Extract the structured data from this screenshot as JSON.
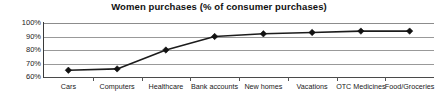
{
  "chart_data": {
    "type": "line",
    "title": "Women purchases (% of consumer purchases)",
    "xlabel": "",
    "ylabel": "",
    "categories": [
      "Cars",
      "Computers",
      "Healthcare",
      "Bank accounts",
      "New homes",
      "Vacations",
      "OTC Medicines",
      "Food/Groceries"
    ],
    "values": [
      65,
      66,
      80,
      90,
      92,
      93,
      94,
      94
    ],
    "series": [
      {
        "name": "Women purchases",
        "values": [
          65,
          66,
          80,
          90,
          92,
          93,
          94,
          94
        ]
      }
    ],
    "ylim": [
      60,
      100
    ],
    "ytick_labels": [
      "100%",
      "90%",
      "80%",
      "70%",
      "60%"
    ],
    "ytick_values": [
      100,
      90,
      80,
      70,
      60
    ],
    "grid": true,
    "legend": false,
    "marker": "diamond",
    "line_color": "#1c1c1c",
    "marker_color": "#111111",
    "grid_color": "#999999",
    "background": "#ffffff"
  }
}
